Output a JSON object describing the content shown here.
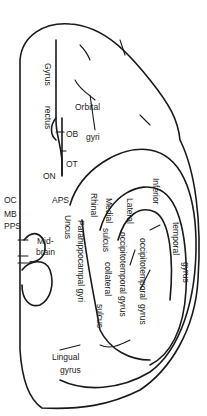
{
  "diagram": {
    "labels": {
      "gyrus_rectus_1": "Gyrus",
      "gyrus_rectus_2": "rectus",
      "orbital": "Orbital",
      "gyri": "gyri",
      "ob": "OB",
      "ot": "OT",
      "on": "ON",
      "oc": "OC",
      "aps": "APS",
      "mb": "MB",
      "pps": "PPS",
      "mid": "Mid-",
      "brain": "brain",
      "uncus": "Uncus",
      "parahippocampal": "Parahippocampal gyri",
      "rhinal": "Rhinal",
      "medial": "Medial",
      "sulcus1": "sulcus",
      "lateral": "Lateral",
      "inferior": "Inferior",
      "temporal": "temporal",
      "gyrus1": "gyrus",
      "occipitotemporal1": "occipitotemporal",
      "gyrus2": "gyrus",
      "occipitotemporal2": "occipitotemporal",
      "gyrus3": "gyrus",
      "collateral": "collateral",
      "sulcus2": "sulcus",
      "lingual": "Lingual",
      "gyrus4": "gyrus"
    },
    "stroke_color": "#1a1a1a"
  }
}
